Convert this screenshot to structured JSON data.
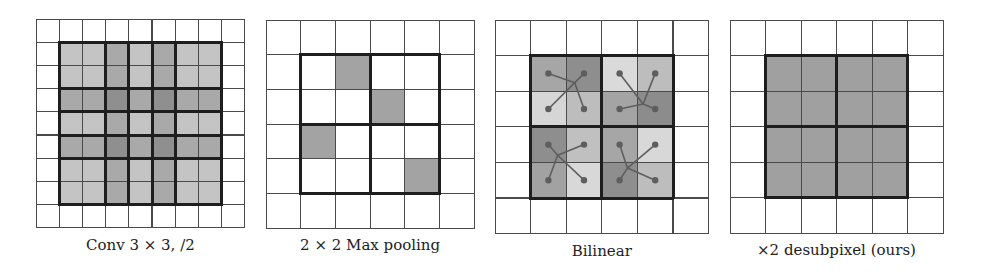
{
  "figure": {
    "panels": [
      {
        "id": "conv",
        "caption": "Conv 3 × 3, /2",
        "grid_size": 9,
        "origin": [
          36,
          19
        ],
        "cell": 23.2,
        "inner_offset": 1,
        "inner_size": 7,
        "axis_overlap": [
          1,
          1,
          2,
          1,
          2,
          1,
          1
        ],
        "shades": {
          "1": "#c4c4c4",
          "2": "#a9a9a9",
          "4": "#8f8f8f"
        },
        "bold_boundaries": [
          0,
          2,
          3,
          4,
          5,
          7
        ]
      },
      {
        "id": "maxpool",
        "caption": "2 × 2 Max pooling",
        "grid_size": 6,
        "origin": [
          266,
          20
        ],
        "cell": 34.7,
        "inner_offset": 1,
        "inner_size": 4,
        "shaded_cells": [
          [
            0,
            1
          ],
          [
            1,
            2
          ],
          [
            2,
            0
          ],
          [
            3,
            3
          ]
        ],
        "shade": "#a3a3a3",
        "bold_boundaries": [
          0,
          2,
          4
        ]
      },
      {
        "id": "bilinear",
        "caption": "Bilinear",
        "grid_size": 6,
        "origin": [
          495,
          20
        ],
        "cell": 35.6,
        "inner_offset": 1,
        "inner_size": 4,
        "shade_matrix": [
          [
            "#a6a6a6",
            "#8e8e8e",
            "#dadada",
            "#bdbdbd"
          ],
          [
            "#d6d6d6",
            "#bdbdbd",
            "#a4a4a4",
            "#8c8c8c"
          ],
          [
            "#8e8e8e",
            "#c0c0c0",
            "#a6a6a6",
            "#d8d8d8"
          ],
          [
            "#a2a2a2",
            "#d8d8d8",
            "#8e8e8e",
            "#bdbdbd"
          ]
        ],
        "sample_points": [
          [
            0.62,
            0.38
          ],
          [
            0.58,
            0.68
          ],
          [
            0.38,
            0.4
          ],
          [
            0.36,
            0.58
          ]
        ],
        "bold_boundaries": [
          0,
          2,
          4
        ],
        "dot_color": "#5e5e5e"
      },
      {
        "id": "desubpixel",
        "caption": "×2 desubpixel (ours)",
        "grid_size": 6,
        "origin": [
          730,
          20
        ],
        "cell": 35.5,
        "inner_offset": 1,
        "inner_size": 4,
        "shade": "#a0a0a0",
        "bold_boundaries": [
          0,
          2,
          4
        ]
      }
    ]
  }
}
